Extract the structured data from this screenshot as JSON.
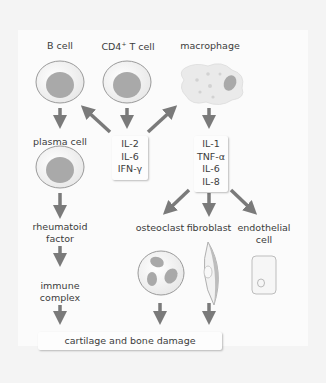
{
  "diagram": {
    "nodes": {
      "b_cell": "B cell",
      "cd4_t_cell": "CD4",
      "cd4_sup": "+",
      "cd4_suffix": " T cell",
      "macrophage": "macrophage",
      "plasma_cell": "plasma cell",
      "rheumatoid_factor_1": "rheumatoid",
      "rheumatoid_factor_2": "factor",
      "immune_complex_1": "immune",
      "immune_complex_2": "complex",
      "osteoclast": "osteoclast",
      "fibroblast": "fibroblast",
      "endothelial_1": "endothelial",
      "endothelial_2": "cell",
      "damage": "cartilage and bone damage"
    },
    "tcell_cytokines": [
      "IL-2",
      "IL-6",
      "IFN-γ"
    ],
    "macrophage_cytokines": [
      "IL-1",
      "TNF-α",
      "IL-6",
      "IL-8"
    ],
    "colors": {
      "arrow": "#7a7a7a",
      "nucleus": "#a9a9a9",
      "cell_fill": "#f3f3f3",
      "background": "#f4f4f4",
      "panel": "#fbfbfb"
    }
  }
}
